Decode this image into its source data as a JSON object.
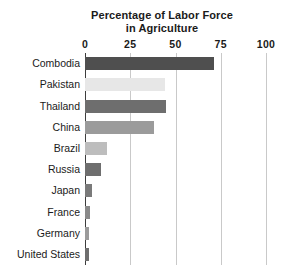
{
  "chart_data": {
    "type": "bar",
    "orientation": "horizontal",
    "title": "Percentage of Labor Force in Agriculture",
    "title_lines": [
      "Percentage of Labor Force",
      "in Agriculture"
    ],
    "xlabel": "",
    "ylabel": "",
    "xlim": [
      0,
      100
    ],
    "xticks": [
      0,
      25,
      50,
      75,
      100
    ],
    "xticklabels": [
      "0",
      "25",
      "50",
      "75",
      "100"
    ],
    "grid": "vertical",
    "legend": "none",
    "categories": [
      "Combodia",
      "Pakistan",
      "Thailand",
      "China",
      "Brazil",
      "Russia",
      "Japan",
      "France",
      "Germany",
      "United States"
    ],
    "values": [
      71,
      44,
      45,
      38,
      12,
      9,
      4,
      3,
      2,
      2
    ],
    "bar_colors": [
      "#4f4f4f",
      "#e7e7e7",
      "#6e6e6e",
      "#9b9b9b",
      "#bdbdbd",
      "#6e6e6e",
      "#7a7a7a",
      "#8a8a8a",
      "#9b9b9b",
      "#6e6e6e"
    ],
    "bars": [
      {
        "label": "Combodia",
        "value": 71,
        "color": "#4f4f4f"
      },
      {
        "label": "Pakistan",
        "value": 44,
        "color": "#e7e7e7"
      },
      {
        "label": "Thailand",
        "value": 45,
        "color": "#6e6e6e"
      },
      {
        "label": "China",
        "value": 38,
        "color": "#9b9b9b"
      },
      {
        "label": "Brazil",
        "value": 12,
        "color": "#bdbdbd"
      },
      {
        "label": "Russia",
        "value": 9,
        "color": "#6e6e6e"
      },
      {
        "label": "Japan",
        "value": 4,
        "color": "#7a7a7a"
      },
      {
        "label": "France",
        "value": 3,
        "color": "#8a8a8a"
      },
      {
        "label": "Germany",
        "value": 2,
        "color": "#9b9b9b"
      },
      {
        "label": "United States",
        "value": 2,
        "color": "#6e6e6e"
      }
    ]
  },
  "colors": {
    "background": "#ffffff",
    "text": "#1a1a1a",
    "gridline": "#c9c9c9",
    "axis": "#3d3d3d"
  }
}
